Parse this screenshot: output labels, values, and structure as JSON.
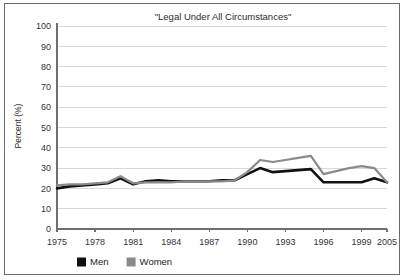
{
  "figure": {
    "border_color": "#6b6b6b",
    "background": "#ffffff"
  },
  "chart_data": {
    "type": "line",
    "title": "\"Legal Under All Circumstances\"",
    "xlabel": "",
    "ylabel": "Percent (%)",
    "ylim": [
      0,
      100
    ],
    "yticks": [
      0,
      10,
      20,
      30,
      40,
      50,
      60,
      70,
      80,
      90,
      100
    ],
    "ytick_labels": [
      "0",
      "10",
      "20",
      "30",
      "40",
      "50",
      "60",
      "70",
      "80",
      "90",
      "100"
    ],
    "grid": "horizontal",
    "legend_position": "bottom-left",
    "categories": [
      "1975",
      "1976",
      "1977",
      "1978",
      "1979",
      "1980",
      "1981",
      "1982",
      "1983",
      "1984",
      "1985",
      "1986",
      "1987",
      "1988",
      "1989",
      "1990",
      "1991",
      "1992",
      "1993",
      "1994",
      "1995",
      "1996",
      "1997",
      "1998",
      "1999",
      "2000",
      "2005"
    ],
    "xtick_labels": [
      "1975",
      "1978",
      "1981",
      "1984",
      "1987",
      "1990",
      "1993",
      "1996",
      "1999",
      "2005"
    ],
    "xtick_categories": [
      "1975",
      "1978",
      "1981",
      "1984",
      "1987",
      "1990",
      "1993",
      "1996",
      "1999",
      "2005"
    ],
    "series": [
      {
        "name": "Men",
        "color": "#111111",
        "width": 2.6,
        "values": [
          20,
          21,
          21.5,
          22,
          22.5,
          25,
          22,
          23.5,
          24,
          23.5,
          23.5,
          23.5,
          23.5,
          24,
          24,
          27,
          30,
          28,
          28.5,
          29,
          29.5,
          23,
          23,
          23,
          23,
          25,
          23
        ]
      },
      {
        "name": "Women",
        "color": "#8a8a8a",
        "width": 2.2,
        "values": [
          21.5,
          22,
          22,
          22.5,
          23,
          26,
          22.5,
          23,
          23,
          23,
          23.5,
          23.5,
          23.5,
          23.5,
          24,
          28,
          34,
          33,
          34,
          35,
          36,
          27,
          28.5,
          30,
          31,
          30,
          23
        ]
      }
    ]
  },
  "legend": {
    "items": [
      {
        "label": "Men",
        "color": "#111111"
      },
      {
        "label": "Women",
        "color": "#8a8a8a"
      }
    ]
  }
}
